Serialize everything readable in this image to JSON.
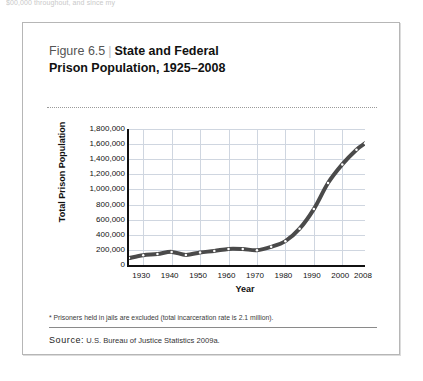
{
  "page": {
    "top_cut_text": "$00,000 throughout, and since my"
  },
  "figure": {
    "number": "Figure 6.5",
    "divider": "|",
    "title_line1": "State and Federal",
    "title_line2": "Prison Population, 1925–2008",
    "footnote": "* Prisoners held in jails are excluded (total incarceration rate is 2.1 million).",
    "source_word": "Source:",
    "source_text": "U.S. Bureau of Justice Statistics 2009a.",
    "colors": {
      "line": "#4a4a4a",
      "marker": "#ffffff",
      "grid": "#cfd6e0",
      "axis": "#111111",
      "card_border": "#b6b6b6",
      "rule": "#8a8a8a"
    }
  },
  "chart_data": {
    "type": "line",
    "title": "State and Federal Prison Population, 1925–2008",
    "xlabel": "Year",
    "ylabel": "Total Prison Population",
    "xlim": [
      1925,
      2008
    ],
    "ylim": [
      0,
      1800000
    ],
    "ytick_labels": [
      "1,800,000",
      "1,600,000",
      "1,400,000",
      "1,200,000",
      "1,000,000",
      "800,000",
      "600,000",
      "400,000",
      "200,000",
      "0"
    ],
    "ytick_values": [
      1800000,
      1600000,
      1400000,
      1200000,
      1000000,
      800000,
      600000,
      400000,
      200000,
      0
    ],
    "xtick_labels": [
      "1930",
      "1940",
      "1950",
      "1960",
      "1970",
      "1980",
      "1990",
      "2000",
      "2008"
    ],
    "xtick_values": [
      1930,
      1940,
      1950,
      1960,
      1970,
      1980,
      1990,
      2000,
      2008
    ],
    "grid": true,
    "legend": "none",
    "markers": true,
    "series": [
      {
        "name": "Total Prison Population",
        "x": [
          1925,
          1930,
          1935,
          1940,
          1945,
          1950,
          1955,
          1960,
          1965,
          1970,
          1975,
          1980,
          1985,
          1990,
          1995,
          2000,
          2005,
          2008
        ],
        "values": [
          91669,
          129453,
          144180,
          173706,
          133649,
          166123,
          185780,
          212953,
          210895,
          196441,
          240593,
          315974,
          480568,
          739980,
          1085022,
          1331278,
          1525924,
          1610446
        ]
      }
    ]
  }
}
